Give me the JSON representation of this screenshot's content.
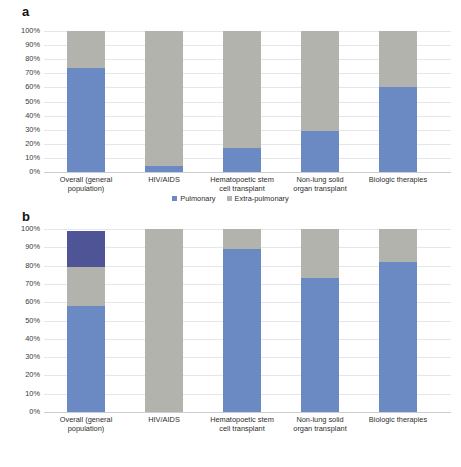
{
  "figure": {
    "panels": [
      {
        "letter": "a",
        "chart_data": {
          "type": "bar",
          "stacked": true,
          "title": "",
          "xlabel": "",
          "ylabel": "",
          "ylim": [
            0,
            100
          ],
          "grid": true,
          "legend_position": "bottom",
          "ytick_labels": [
            "100%",
            "90%",
            "80%",
            "70%",
            "60%",
            "50%",
            "40%",
            "30%",
            "20%",
            "10%",
            "0%"
          ],
          "ytick_values": [
            100,
            90,
            80,
            70,
            60,
            50,
            40,
            30,
            20,
            10,
            0
          ],
          "categories": [
            "Overall (general\npopulation)",
            "HIV/AIDS",
            "Hematopoetic stem\ncell transplant",
            "Non-lung solid\norgan transplant",
            "Biologic therapies"
          ],
          "series": [
            {
              "name": "Pulmonary",
              "color": "#6b8ac4",
              "values": [
                74,
                4,
                17,
                29,
                60
              ]
            },
            {
              "name": "Extra-pulmonary",
              "color": "#b3b3ae",
              "values": [
                26,
                96,
                83,
                71,
                40
              ]
            }
          ]
        }
      },
      {
        "letter": "b",
        "chart_data": {
          "type": "bar",
          "stacked": true,
          "title": "",
          "xlabel": "",
          "ylabel": "",
          "ylim": [
            0,
            100
          ],
          "grid": true,
          "legend_position": "bottom",
          "ytick_labels": [
            "100%",
            "90%",
            "80%",
            "70%",
            "60%",
            "50%",
            "40%",
            "30%",
            "20%",
            "10%",
            "0%"
          ],
          "ytick_values": [
            100,
            90,
            80,
            70,
            60,
            50,
            40,
            30,
            20,
            10,
            0
          ],
          "categories": [
            "Overall (general\npopulation)",
            "HIV/AIDS",
            "Hematopoetic stem\ncell transplant",
            "Non-lung solid\norgan transplant",
            "Biologic therapies"
          ],
          "series": [
            {
              "name": "Skin/soft tissue",
              "color": "#6b8ac4",
              "values": [
                58,
                0,
                89,
                73,
                82
              ]
            },
            {
              "name": "Disseminated",
              "color": "#b3b3ae",
              "values": [
                21,
                100,
                11,
                27,
                18
              ]
            },
            {
              "name": "Other",
              "color": "#4f5496",
              "values": [
                20,
                0,
                0,
                0,
                0
              ]
            }
          ]
        }
      }
    ]
  }
}
